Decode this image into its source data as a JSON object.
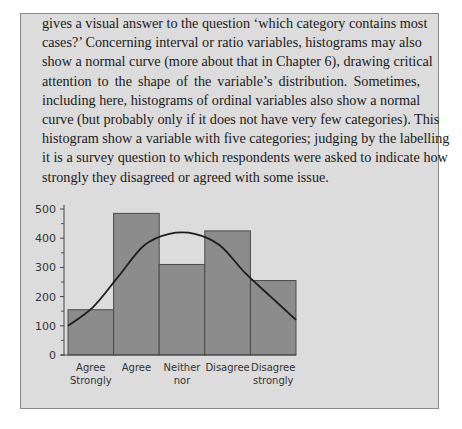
{
  "text": {
    "lines": [
      "gives a visual answer to the question ‘which category contains most",
      "cases?’ Concerning interval or ratio variables, histograms may also",
      "show a normal curve (more about that in Chapter 6), drawing critical",
      "attention to the shape of the variable’s distribution. Sometimes,",
      "including here, histograms of ordinal variables also show a normal",
      "curve (but probably only if it does not have very few categories). This",
      "histogram show a variable with five categories; judging by the labelling",
      "it is a survey question to which respondents were asked to indicate how",
      "strongly they disagreed or agreed with some issue."
    ]
  },
  "colors": {
    "box_background": "#dcdcdc",
    "bar_fill": "#8c8c8c",
    "bar_stroke": "#4a4a4a",
    "curve": "#1e1e1e"
  },
  "chart_data": {
    "type": "bar",
    "title": "",
    "xlabel": "",
    "ylabel": "",
    "categories": [
      "Agree Strongly",
      "Agree",
      "Neither nor",
      "Disagree",
      "Disagree strongly"
    ],
    "category_label_lines": [
      [
        "Agree",
        "Strongly"
      ],
      [
        "Agree"
      ],
      [
        "Neither",
        "nor"
      ],
      [
        "Disagree"
      ],
      [
        "Disagree",
        "strongly"
      ]
    ],
    "values": [
      155,
      485,
      310,
      425,
      255
    ],
    "ylim": [
      0,
      500
    ],
    "yticks": [
      0,
      100,
      200,
      300,
      400,
      500
    ],
    "yticks_minor": [
      50,
      150,
      250,
      350,
      450
    ],
    "grid": false,
    "legend": null,
    "overlay": {
      "type": "normal_curve",
      "points": [
        [
          0.0,
          100
        ],
        [
          0.5,
          165
        ],
        [
          1.0,
          270
        ],
        [
          1.5,
          375
        ],
        [
          2.0,
          415
        ],
        [
          2.5,
          415
        ],
        [
          3.0,
          375
        ],
        [
          3.5,
          280
        ],
        [
          4.0,
          200
        ],
        [
          4.5,
          120
        ]
      ]
    }
  }
}
